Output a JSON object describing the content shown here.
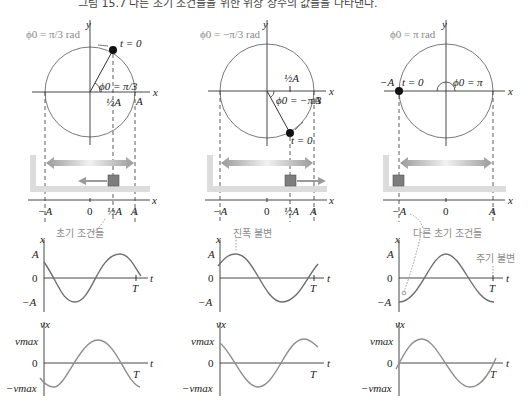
{
  "caption": "그림 15.7 다른 초기 조건들을 위한 위상 상수의 값들을 나타낸다.",
  "colors": {
    "axis": "#333333",
    "circle": "#7a7a7a",
    "wave": "#6e6e6e",
    "gray_text": "#8a8a8a",
    "block": "#7d7d7d",
    "arrow": "#9a9a9a",
    "wall": "#d9d9d9"
  },
  "panels": [
    {
      "phase_label": "ϕ0 = π/3 rad",
      "angle_label": "ϕ0 = π/3",
      "start_label": "t = 0",
      "circle_tick": "½A",
      "circle_a": "A",
      "axis_x": "x",
      "axis_y": "y",
      "number_line": [
        "−A",
        "0",
        "½A",
        "A"
      ],
      "annotation": "초기 조건들",
      "x_graph": {
        "ylabel": "x",
        "ticks": [
          "A",
          "0",
          "−A"
        ],
        "tlabel": "t",
        "period": "T"
      },
      "v_graph": {
        "ylabel": "vx",
        "ticks": [
          "vmax",
          "0",
          "−vmax"
        ],
        "tlabel": "t",
        "period": "T"
      }
    },
    {
      "phase_label": "ϕ0 = −π/3 rad",
      "angle_label": "ϕ0 = −π/3",
      "start_label": "t = 0",
      "circle_tick": "½A",
      "circle_a": "A",
      "axis_x": "x",
      "axis_y": "y",
      "number_line": [
        "−A",
        "0",
        "½A",
        "A"
      ],
      "annotation": "진폭 불변",
      "x_graph": {
        "ylabel": "x",
        "ticks": [
          "A",
          "0",
          "−A"
        ],
        "tlabel": "t",
        "period": "T"
      },
      "v_graph": {
        "ylabel": "vx",
        "ticks": [
          "vmax",
          "0",
          "−vmax"
        ],
        "tlabel": "t",
        "period": "T"
      }
    },
    {
      "phase_label": "ϕ0 = π rad",
      "angle_label": "ϕ0 = π",
      "start_label": "t = 0",
      "circle_neg_a": "−A",
      "axis_x": "x",
      "axis_y": "y",
      "number_line": [
        "−A",
        "0",
        "A"
      ],
      "annotation": "다른 초기 조건들",
      "annotation2": "주기 불변",
      "x_graph": {
        "ylabel": "x",
        "ticks": [
          "A",
          "0",
          "−A"
        ],
        "tlabel": "t",
        "period": "T"
      },
      "v_graph": {
        "ylabel": "vx",
        "ticks": [
          "vmax",
          "0",
          "−vmax"
        ],
        "tlabel": "t",
        "period": "T"
      }
    }
  ]
}
